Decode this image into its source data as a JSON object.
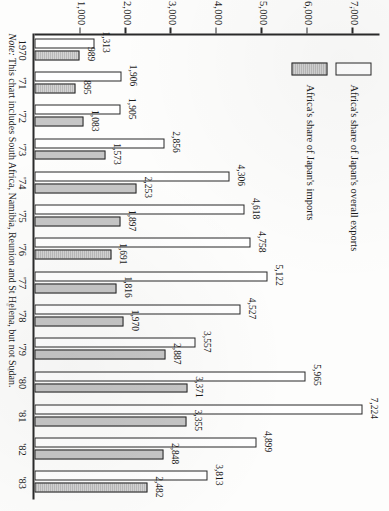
{
  "chart_data": {
    "type": "bar",
    "orientation": "vertical-printed-rotated",
    "title": "",
    "xlabel": "",
    "ylabel": "",
    "categories": [
      "1970",
      "'71",
      "'72",
      "'73",
      "'74",
      "'75",
      "'76",
      "'77",
      "'78",
      "'79",
      "'80",
      "'81",
      "'82",
      "'83"
    ],
    "series": [
      {
        "name": "Africa's share of Japan's overall exports",
        "style": "white-outline",
        "values": [
          1313,
          1906,
          1905,
          2856,
          4306,
          4618,
          4758,
          5122,
          4527,
          3557,
          5965,
          7224,
          4899,
          3813
        ],
        "labels": [
          "1,313",
          "1,906",
          "1,905",
          "2,856",
          "4,306",
          "4,618",
          "4,758",
          "5,122",
          "4,527",
          "3,557",
          "5,965",
          "7,224",
          "4,899",
          "3,813"
        ]
      },
      {
        "name": "Africa's share of Japan's imports",
        "style": "grey-fill",
        "values": [
          989,
          895,
          1083,
          1573,
          2253,
          1897,
          1691,
          1816,
          1970,
          2887,
          3371,
          3355,
          2848,
          2482
        ],
        "labels": [
          "989",
          "895",
          "1,083",
          "1,573",
          "2,253",
          "1,897",
          "1,691",
          "1,816",
          "1,970",
          "2,887",
          "3,371",
          "3,355",
          "2,848",
          "2,482"
        ]
      }
    ],
    "ticks": [
      1000,
      2000,
      3000,
      4000,
      5000,
      6000,
      7000
    ],
    "tick_labels": [
      "1,000",
      "2,000",
      "3,000",
      "4,000",
      "5,000",
      "6,000",
      "7,000"
    ],
    "ylim": [
      0,
      7600
    ],
    "grid": false,
    "legend_position": "upper-left"
  },
  "legend": {
    "items": [
      {
        "label": "Africa's share of Japan's overall exports",
        "swatch": "white-outline"
      },
      {
        "label": "Africa's share of Japan's imports",
        "swatch": "grey-fill"
      }
    ]
  },
  "note": {
    "prefix": "Note:",
    "text": " This chart includes South Africa, Namibia, Reunion and St Helena, but not Sudan."
  }
}
